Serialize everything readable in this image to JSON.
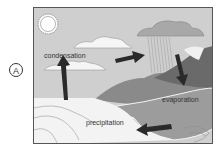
{
  "option": {
    "label": "A"
  },
  "diagram": {
    "labels": {
      "condensation": "condensation",
      "evaporation": "evaporation",
      "precipitation": "precipitation"
    },
    "colors": {
      "sky": "#cfcfcf",
      "cloud_white": "#f4f4f4",
      "rain_cloud": "#a9a9a9",
      "mountain_dark": "#6e6e6e",
      "mountain_mid": "#8c8c8c",
      "land": "#9a9a9a",
      "water": "#f2f2f2",
      "arrow": "#2a2a2a"
    }
  }
}
